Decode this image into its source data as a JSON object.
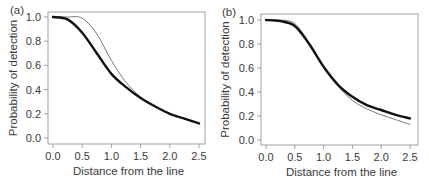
{
  "chart_data": [
    {
      "type": "line",
      "panel_label": "(a)",
      "xlabel": "Distance from the line",
      "ylabel": "Probability of detection",
      "xlim": [
        0,
        2.5
      ],
      "ylim": [
        0,
        1.0
      ],
      "xticks": [
        "0.0",
        "0.5",
        "1.0",
        "1.5",
        "2.0",
        "2.5"
      ],
      "yticks": [
        "0.0",
        "0.2",
        "0.4",
        "0.6",
        "0.8",
        "1.0"
      ],
      "grid": false,
      "x": [
        0,
        0.25,
        0.5,
        0.75,
        1.0,
        1.25,
        1.5,
        1.75,
        2.0,
        2.25,
        2.5
      ],
      "series": [
        {
          "name": "thick",
          "line_width": 2.4,
          "color": "#111111",
          "values": [
            1.0,
            0.98,
            0.87,
            0.7,
            0.53,
            0.42,
            0.33,
            0.26,
            0.2,
            0.16,
            0.12
          ]
        },
        {
          "name": "thin",
          "line_width": 0.8,
          "color": "#555555",
          "values": [
            1.0,
            1.0,
            0.99,
            0.86,
            0.64,
            0.46,
            0.34,
            0.26,
            0.2,
            0.16,
            0.12
          ]
        }
      ]
    },
    {
      "type": "line",
      "panel_label": "(b)",
      "xlabel": "Distance from the line",
      "ylabel": "Probability of detection",
      "xlim": [
        0,
        2.5
      ],
      "ylim": [
        0,
        1.0
      ],
      "xticks": [
        "0.0",
        "0.5",
        "1.0",
        "1.5",
        "2.0",
        "2.5"
      ],
      "yticks": [
        "0.0",
        "0.2",
        "0.4",
        "0.6",
        "0.8",
        "1.0"
      ],
      "grid": false,
      "x": [
        0,
        0.25,
        0.5,
        0.75,
        1.0,
        1.25,
        1.5,
        1.75,
        2.0,
        2.25,
        2.5
      ],
      "series": [
        {
          "name": "thick",
          "line_width": 2.4,
          "color": "#111111",
          "values": [
            1.0,
            0.99,
            0.95,
            0.8,
            0.61,
            0.46,
            0.36,
            0.29,
            0.25,
            0.21,
            0.18
          ]
        },
        {
          "name": "thin",
          "line_width": 0.8,
          "color": "#555555",
          "values": [
            1.0,
            1.0,
            0.97,
            0.81,
            0.61,
            0.45,
            0.33,
            0.26,
            0.21,
            0.17,
            0.13
          ]
        }
      ]
    }
  ]
}
